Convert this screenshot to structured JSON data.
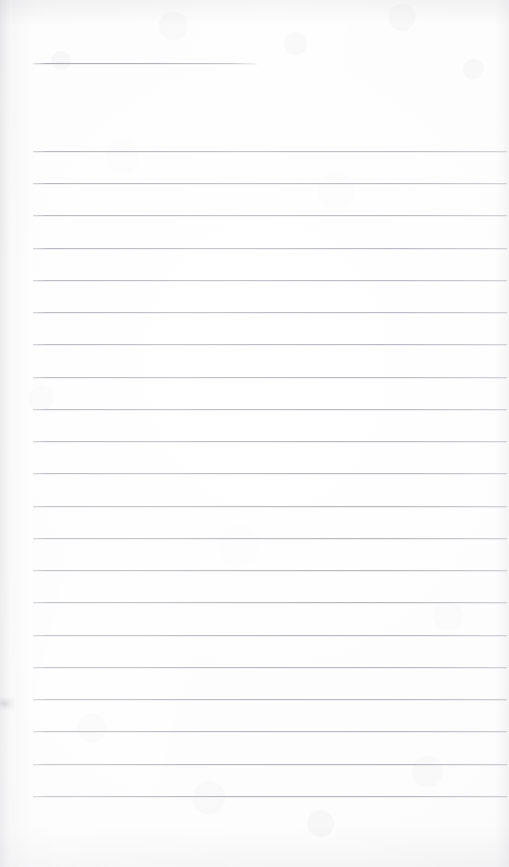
{
  "document": {
    "kind": "scanned-lined-notepad-page",
    "title": "Blank Lined Notepad Page",
    "written_content": "",
    "page_width": 509,
    "page_height": 867
  },
  "paper": {
    "background_color": "#fdfdfd",
    "edge_tint_color": "#bdbdc3",
    "texture": "faint scanner grain"
  },
  "rules": {
    "line_color": "#a8a8b0",
    "line_thickness_px": 1,
    "left_margin_x": 33,
    "right_edge_x": 507,
    "spacing_px": 32.2,
    "header_rule": {
      "label": "header-rule",
      "x": 33,
      "y": 63,
      "width": 224
    },
    "body_rules": [
      {
        "y": 151
      },
      {
        "y": 183
      },
      {
        "y": 215
      },
      {
        "y": 248
      },
      {
        "y": 280
      },
      {
        "y": 312
      },
      {
        "y": 344
      },
      {
        "y": 377
      },
      {
        "y": 409
      },
      {
        "y": 441
      },
      {
        "y": 473
      },
      {
        "y": 506
      },
      {
        "y": 538
      },
      {
        "y": 570
      },
      {
        "y": 602
      },
      {
        "y": 635
      },
      {
        "y": 667
      },
      {
        "y": 699
      },
      {
        "y": 731
      },
      {
        "y": 764
      },
      {
        "y": 796
      }
    ]
  },
  "marks": {
    "left_margin_smudge": {
      "x": 0,
      "y": 697,
      "width": 14,
      "height": 13
    }
  }
}
